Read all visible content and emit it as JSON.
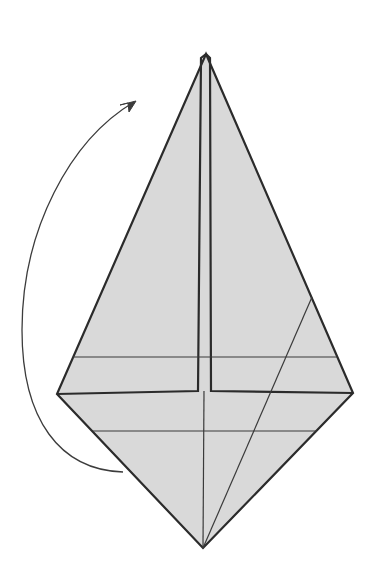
{
  "diagram": {
    "type": "origami-fold-step",
    "colors": {
      "background": "#ffffff",
      "paper": "#d9d9d9",
      "outline": "#2b2b2b",
      "crease": "#3a3a3a",
      "arrow": "#3c3c3c"
    },
    "shape": {
      "top": [
        206,
        54
      ],
      "left": [
        57,
        394
      ],
      "right": [
        353,
        393
      ],
      "bottom": [
        203,
        548
      ]
    },
    "flaps": {
      "left_flap": [
        [
          201,
          58
        ],
        [
          198,
          391
        ],
        [
          57,
          394
        ]
      ],
      "right_flap": [
        [
          210,
          58
        ],
        [
          211,
          391
        ],
        [
          353,
          393
        ]
      ]
    },
    "creases": [
      {
        "name": "horizontal-crease-upper",
        "from": [
          73,
          357
        ],
        "to": [
          337,
          357
        ]
      },
      {
        "name": "horizontal-crease-lower",
        "from": [
          93,
          431
        ],
        "to": [
          317,
          431
        ]
      },
      {
        "name": "vertical-center-crease",
        "from": [
          204,
          391
        ],
        "to": [
          203,
          548
        ]
      },
      {
        "name": "diagonal-crease",
        "from": [
          312,
          297
        ],
        "to": [
          203,
          548
        ]
      }
    ],
    "arrow": {
      "name": "fold-over-arrow",
      "path": "M 123 472 C 60 470, 22 420, 22 330 C 22 230, 70 140, 134 102",
      "head": [
        136,
        101
      ]
    }
  }
}
